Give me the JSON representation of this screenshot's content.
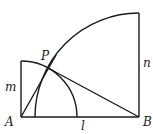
{
  "diagram": {
    "labels": {
      "A": "A",
      "B": "B",
      "P": "P",
      "m": "m",
      "n": "n",
      "l": "l"
    },
    "points": {
      "A": [
        21,
        117
      ],
      "B": [
        139,
        117
      ],
      "P": [
        48,
        68
      ],
      "m_top": [
        21,
        61
      ],
      "n_top": [
        139,
        13
      ]
    },
    "segments": [
      {
        "name": "AB",
        "from": "A",
        "to": "B",
        "label": "l"
      },
      {
        "name": "m",
        "from": "A",
        "to": "m_top",
        "label": "m"
      },
      {
        "name": "n",
        "from": "B",
        "to": "n_top",
        "label": "n"
      },
      {
        "name": "AP",
        "from": "A",
        "to": "P"
      },
      {
        "name": "PB",
        "from": "P",
        "to": "B"
      }
    ],
    "arcs": [
      {
        "name": "arc-center-A-radius-m",
        "center": "A",
        "radius": 56
      },
      {
        "name": "arc-center-B-radius-n",
        "center": "B",
        "radius": 104
      }
    ],
    "stroke_color": "#1a1a1a"
  }
}
